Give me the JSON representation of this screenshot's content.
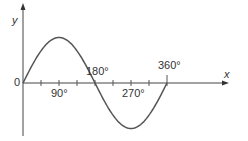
{
  "chart_data": {
    "type": "line",
    "title": "",
    "xlabel": "x",
    "ylabel": "y",
    "origin_label": "0",
    "x_tick_labels": [
      "90°",
      "180°",
      "270°",
      "360°"
    ],
    "x_ticks_degrees": [
      0,
      45,
      90,
      135,
      180,
      225,
      270,
      315,
      360
    ],
    "series": [
      {
        "name": "y = sin x",
        "x": [
          0,
          45,
          90,
          135,
          180,
          225,
          270,
          315,
          360
        ],
        "values": [
          0,
          0.707,
          1,
          0.707,
          0,
          -0.707,
          -1,
          -0.707,
          0
        ]
      }
    ],
    "xlim": [
      0,
      360
    ],
    "ylim": [
      -1,
      1
    ],
    "grid": false,
    "legend": "none",
    "line_color": "#555555"
  }
}
